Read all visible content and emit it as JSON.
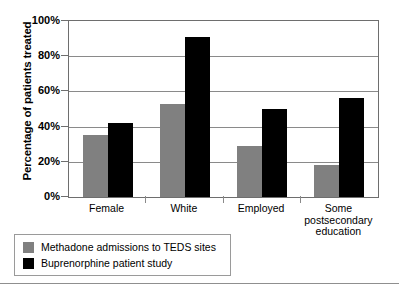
{
  "chart_data": {
    "type": "bar",
    "title": "",
    "xlabel": "",
    "ylabel": "Percentage of patients treated",
    "ylim": [
      0,
      100
    ],
    "ytick_labels": [
      "0%",
      "20%",
      "40%",
      "60%",
      "80%",
      "100%"
    ],
    "ytick_values": [
      0,
      20,
      40,
      60,
      80,
      100
    ],
    "grid": true,
    "legend_position": "bottom-left",
    "categories": [
      "Female",
      "White",
      "Employed",
      "Some postsecondary education"
    ],
    "category_lines": [
      [
        "Female"
      ],
      [
        "White"
      ],
      [
        "Employed"
      ],
      [
        "Some",
        "postsecondary",
        "education"
      ]
    ],
    "series": [
      {
        "name": "Methadone admissions to TEDS sites",
        "color": "#808080",
        "values": [
          35,
          53,
          29,
          18
        ]
      },
      {
        "name": "Buprenorphine patient study",
        "color": "#000000",
        "values": [
          42,
          91,
          50,
          56
        ]
      }
    ]
  },
  "legend": {
    "entries": [
      "Methadone admissions to TEDS sites",
      "Buprenorphine patient study"
    ]
  }
}
